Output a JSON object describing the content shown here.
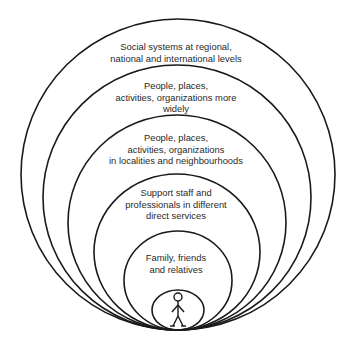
{
  "diagram": {
    "type": "nested-circles",
    "stroke_color": "#1a1a1a",
    "rings": [
      {
        "id": "social-systems",
        "lines": [
          "Social systems at regional,",
          "national and international levels"
        ]
      },
      {
        "id": "wider-community",
        "lines": [
          "People, places,",
          "activities, organizations more",
          "widely"
        ]
      },
      {
        "id": "local-community",
        "lines": [
          "People, places,",
          "activities, organizations",
          "in localities and neighbourhoods"
        ]
      },
      {
        "id": "support-staff",
        "lines": [
          "Support staff and",
          "professionals in different",
          "direct services"
        ]
      },
      {
        "id": "family",
        "lines": [
          "Family, friends",
          "and relatives"
        ]
      }
    ],
    "center": {
      "icon": "person-icon"
    }
  }
}
